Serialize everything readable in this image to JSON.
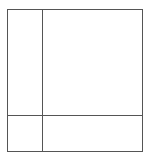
{
  "diagram": {
    "type": "grid-partition",
    "line_color": "#555555",
    "background_color": "#ffffff",
    "frame": {
      "x": 7,
      "y": 9,
      "width": 136,
      "height": 143
    },
    "vertical_divider_x": 42,
    "horizontal_divider_y": 115,
    "cells": [
      {
        "id": "top-left",
        "label": ""
      },
      {
        "id": "top-right",
        "label": ""
      },
      {
        "id": "bottom-left",
        "label": ""
      },
      {
        "id": "bottom-right",
        "label": ""
      }
    ]
  }
}
